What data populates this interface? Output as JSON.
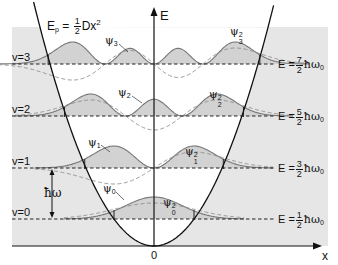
{
  "diagram": {
    "title_formula": {
      "prefix": "E",
      "sub": "p",
      "equals": "=",
      "frac_num": "1",
      "frac_den": "2",
      "rest": "Dx",
      "exp": "2"
    },
    "axes": {
      "y_label": "E",
      "x_label": "x",
      "origin_label": "0"
    },
    "levels": [
      {
        "v_label": "v=0",
        "psi": "ψ",
        "psi_index": "0",
        "e_prefix": "E =",
        "num": "1",
        "den": "2",
        "unit": "ħω",
        "unit_sub": "0",
        "y": 219,
        "n": 0
      },
      {
        "v_label": "v=1",
        "psi": "ψ",
        "psi_index": "1",
        "e_prefix": "E =",
        "num": "3",
        "den": "2",
        "unit": "ħω",
        "unit_sub": "0",
        "y": 168,
        "n": 1
      },
      {
        "v_label": "v=2",
        "psi": "ψ",
        "psi_index": "2",
        "e_prefix": "E =",
        "num": "5",
        "den": "2",
        "unit": "ħω",
        "unit_sub": "0",
        "y": 116,
        "n": 2
      },
      {
        "v_label": "v=3",
        "psi": "ψ",
        "psi_index": "3",
        "e_prefix": "E =",
        "num": "7",
        "den": "2",
        "unit": "ħω",
        "unit_sub": "0",
        "y": 64,
        "n": 3
      }
    ],
    "spacing_label": "ħω",
    "psi_sq_exp": "2",
    "colors": {
      "shade": "#e6e6e6",
      "fill_prob": "#d2d2d2",
      "curve_prob": "#777777",
      "curve_psi": "#8a8a8a",
      "axis": "#111111",
      "dashed": "#222222"
    },
    "geometry": {
      "origin_x": 154,
      "origin_y": 246,
      "parabola_k": 0.01683,
      "px_per_xi": 40,
      "psi_amp": 16,
      "prob_amp": 22,
      "shade_left": 12,
      "shade_right": 328,
      "shade_top": 27,
      "axis_top": 8,
      "axis_right": 320,
      "dash_left": 12,
      "dash_right": 275
    }
  }
}
